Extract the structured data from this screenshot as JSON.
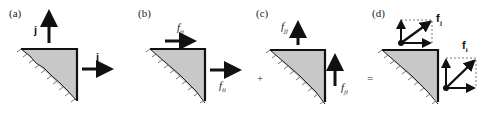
{
  "panels": [
    {
      "id": "a",
      "label": "(a)",
      "vectors": [
        {
          "name": "j",
          "direction": "up"
        },
        {
          "name": "i",
          "direction": "right"
        }
      ]
    },
    {
      "id": "b",
      "label": "(b)",
      "vectors": [
        {
          "name": "f",
          "sub": "ij",
          "direction": "right-top"
        },
        {
          "name": "f",
          "sub": "ii",
          "direction": "right-side"
        }
      ]
    },
    {
      "id": "c",
      "label": "(c)",
      "vectors": [
        {
          "name": "f",
          "sub": "jj",
          "direction": "up-top"
        },
        {
          "name": "f",
          "sub": "ji",
          "direction": "up-side"
        }
      ]
    },
    {
      "id": "d",
      "label": "(d)",
      "vectors": [
        {
          "name": "f",
          "sub": "j",
          "bold": true
        },
        {
          "name": "f",
          "sub": "i",
          "bold": true
        }
      ]
    }
  ],
  "operators": {
    "plus": "+",
    "equals": "="
  },
  "colors": {
    "fill": "#c8c8c8",
    "stroke": "#111111",
    "dashed": "#555555"
  }
}
